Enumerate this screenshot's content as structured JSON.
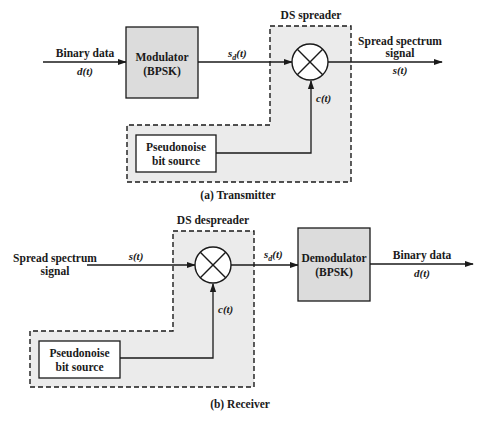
{
  "transmitter": {
    "caption": "(a) Transmitter",
    "input_label": "Binary data",
    "input_signal": "d(t)",
    "modulator": {
      "line1": "Modulator",
      "line2": "(BPSK)"
    },
    "sd_signal": "s",
    "sd_sub": "d",
    "sd_tail": "(t)",
    "spreader_title": "DS spreader",
    "code_signal": "c(t)",
    "pn_source": {
      "line1": "Pseudonoise",
      "line2": "bit source"
    },
    "output_label_1": "Spread spectrum",
    "output_label_2": "signal",
    "output_signal": "s(t)"
  },
  "receiver": {
    "caption": "(b) Receiver",
    "input_label_1": "Spread spectrum",
    "input_label_2": "signal",
    "input_signal": "s(t)",
    "despreader_title": "DS despreader",
    "code_signal": "c(t)",
    "pn_source": {
      "line1": "Pseudonoise",
      "line2": "bit source"
    },
    "sd_signal": "s",
    "sd_sub": "d",
    "sd_tail": "(t)",
    "demodulator": {
      "line1": "Demodulator",
      "line2": "(BPSK)"
    },
    "output_label": "Binary data",
    "output_signal": "d(t)"
  },
  "colors": {
    "block_fill": "#dcdcdc",
    "region_fill": "#ebebeb",
    "stroke": "#1a1a1a",
    "background": "#ffffff"
  }
}
